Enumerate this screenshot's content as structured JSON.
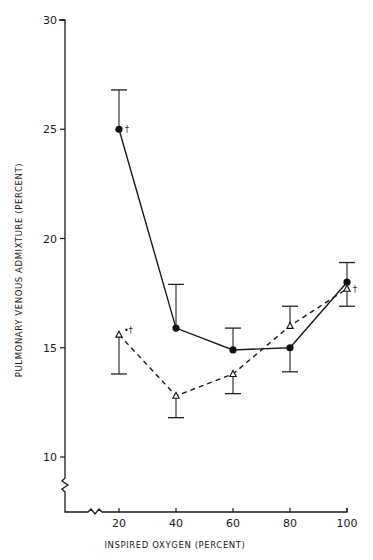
{
  "chart_data": {
    "type": "line",
    "title": "",
    "xlabel": "INSPIRED OXYGEN (PERCENT)",
    "ylabel": "PULMONARY VENOUS ADMIXTURE (PERCENT)",
    "x": [
      20,
      40,
      60,
      80,
      100
    ],
    "x_ticks": [
      "20",
      "40",
      "60",
      "80",
      "100"
    ],
    "y_ticks": [
      "10",
      "15",
      "20",
      "25",
      "30"
    ],
    "ylim": [
      8,
      30
    ],
    "xlim": [
      0,
      100
    ],
    "axis_breaks": [
      "y-axis below 10",
      "x-axis below 20"
    ],
    "grid": false,
    "legend": "none",
    "series": [
      {
        "name": "filled circles (solid line)",
        "marker": "filled-circle",
        "line": "solid",
        "values": [
          25.0,
          15.9,
          14.9,
          15.0,
          18.0
        ],
        "error_bars": [
          {
            "x": 20,
            "dir": "up",
            "to": 26.8
          },
          {
            "x": 40,
            "dir": "up",
            "to": 17.9
          },
          {
            "x": 60,
            "dir": "up",
            "to": 15.9
          },
          {
            "x": 80,
            "dir": "down",
            "to": 13.9
          },
          {
            "x": 100,
            "dir": "up",
            "to": 18.9
          }
        ],
        "annotations": [
          {
            "x": 20,
            "text": "†"
          }
        ]
      },
      {
        "name": "open triangles (dashed line)",
        "marker": "open-triangle",
        "line": "dashed",
        "values": [
          15.6,
          12.8,
          13.8,
          16.0,
          17.7
        ],
        "error_bars": [
          {
            "x": 20,
            "dir": "down",
            "to": 13.8
          },
          {
            "x": 40,
            "dir": "down",
            "to": 11.8
          },
          {
            "x": 60,
            "dir": "down",
            "to": 12.9
          },
          {
            "x": 80,
            "dir": "up",
            "to": 16.9
          },
          {
            "x": 100,
            "dir": "down",
            "to": 16.9
          }
        ],
        "annotations": [
          {
            "x": 20,
            "text": "•†"
          },
          {
            "x": 100,
            "text": "†"
          }
        ]
      }
    ]
  }
}
